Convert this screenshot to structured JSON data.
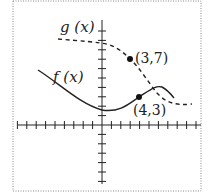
{
  "chart_data": {
    "type": "line",
    "title": "",
    "xlabel": "",
    "ylabel": "",
    "grid": false,
    "xlim": [
      -10,
      11
    ],
    "ylim": [
      -7,
      10
    ],
    "series": [
      {
        "name": "f(x)",
        "style": "solid",
        "label": "f (x)",
        "points": [
          [
            -7,
            5.9
          ],
          [
            -4,
            3.7
          ],
          [
            -2,
            2.0
          ],
          [
            0,
            1.0
          ],
          [
            2,
            1.5
          ],
          [
            4,
            3.0
          ],
          [
            5.5,
            4.1
          ],
          [
            7,
            3.2
          ]
        ]
      },
      {
        "name": "g(x)",
        "style": "dashed",
        "label": "g (x)",
        "points": [
          [
            -7,
            9.2
          ],
          [
            -4,
            9.0
          ],
          [
            0,
            8.6
          ],
          [
            3,
            7.0
          ],
          [
            5,
            4.8
          ],
          [
            6.5,
            3.2
          ],
          [
            7.5,
            2.2
          ],
          [
            9,
            1.9
          ]
        ]
      }
    ],
    "annotations": [
      {
        "text": "(3,7)",
        "x": 3,
        "y": 7,
        "series": "g(x)"
      },
      {
        "text": "(4,3)",
        "x": 4,
        "y": 3,
        "series": "f(x)"
      }
    ]
  },
  "labels": {
    "g": "g (x)",
    "f": "f (x)",
    "p1": "(3,7)",
    "p2": "(4,3)"
  }
}
